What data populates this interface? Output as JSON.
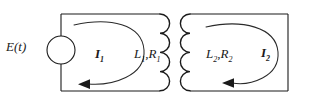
{
  "figure": {
    "name": "coupled-inductor-circuit",
    "type": "electrical-circuit-diagram",
    "stroke_color": "#1a1a1a",
    "background_color": "#ffffff"
  },
  "labels": {
    "source": "E(t)",
    "current_1_base": "I",
    "current_1_sub": "1",
    "current_2_base": "I",
    "current_2_sub": "2",
    "inductor_1_base": "L",
    "inductor_1_sub": "1",
    "resistor_1_base": "R",
    "resistor_1_sub": "1",
    "inductor_2_base": "L",
    "inductor_2_sub": "2",
    "resistor_2_base": "R",
    "resistor_2_sub": "2",
    "separator": ","
  },
  "components": {
    "voltage_source": {
      "name": "E(t)",
      "shape": "circle"
    },
    "coil_primary": {
      "name": "L1,R1",
      "turns": 4
    },
    "coil_secondary": {
      "name": "L2,R2",
      "turns": 4
    },
    "mesh_current_primary": {
      "name": "I1",
      "direction": "counterclockwise"
    },
    "mesh_current_secondary": {
      "name": "I2",
      "direction": "counterclockwise"
    }
  }
}
